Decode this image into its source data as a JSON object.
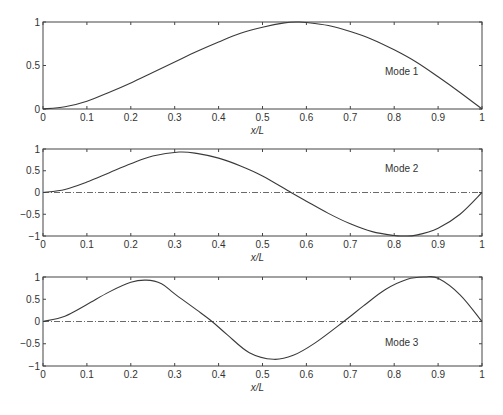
{
  "chart_data": [
    {
      "type": "line",
      "title": "",
      "xlabel": "x/L",
      "ylabel": "",
      "xlim": [
        0,
        1
      ],
      "ylim": [
        0,
        1
      ],
      "xticks": [
        "0",
        "0.1",
        "0.2",
        "0.3",
        "0.4",
        "0.5",
        "0.6",
        "0.7",
        "0.8",
        "0.9",
        "1"
      ],
      "yticks": [
        "0",
        "0.5",
        "1"
      ],
      "annotation": "Mode 1",
      "zero_line": false,
      "series": [
        {
          "name": "Mode 1",
          "x": [
            0,
            0.05,
            0.1,
            0.15,
            0.2,
            0.25,
            0.3,
            0.35,
            0.4,
            0.45,
            0.5,
            0.55,
            0.58,
            0.6,
            0.65,
            0.7,
            0.75,
            0.8,
            0.85,
            0.9,
            0.95,
            1
          ],
          "y": [
            0,
            0.025,
            0.09,
            0.19,
            0.3,
            0.42,
            0.54,
            0.66,
            0.77,
            0.87,
            0.94,
            0.99,
            1.0,
            0.995,
            0.96,
            0.89,
            0.8,
            0.68,
            0.54,
            0.37,
            0.19,
            0
          ]
        }
      ]
    },
    {
      "type": "line",
      "title": "",
      "xlabel": "x/L",
      "ylabel": "",
      "xlim": [
        0,
        1
      ],
      "ylim": [
        -1,
        1
      ],
      "xticks": [
        "0",
        "0.1",
        "0.2",
        "0.3",
        "0.4",
        "0.5",
        "0.6",
        "0.7",
        "0.8",
        "0.9",
        "1"
      ],
      "yticks": [
        "-1",
        "-0.5",
        "0",
        "0.5",
        "1"
      ],
      "annotation": "Mode 2",
      "zero_line": true,
      "series": [
        {
          "name": "Mode 2",
          "x": [
            0,
            0.05,
            0.1,
            0.15,
            0.2,
            0.25,
            0.31,
            0.35,
            0.4,
            0.45,
            0.5,
            0.565,
            0.6,
            0.65,
            0.7,
            0.75,
            0.8,
            0.82,
            0.85,
            0.9,
            0.95,
            1
          ],
          "y": [
            0,
            0.07,
            0.24,
            0.45,
            0.66,
            0.84,
            0.93,
            0.9,
            0.79,
            0.61,
            0.38,
            0,
            -0.2,
            -0.48,
            -0.72,
            -0.9,
            -0.99,
            -1.0,
            -0.98,
            -0.82,
            -0.5,
            0
          ]
        }
      ]
    },
    {
      "type": "line",
      "title": "",
      "xlabel": "x/L",
      "ylabel": "",
      "xlim": [
        0,
        1
      ],
      "ylim": [
        -1,
        1
      ],
      "xticks": [
        "0",
        "0.1",
        "0.2",
        "0.3",
        "0.4",
        "0.5",
        "0.6",
        "0.7",
        "0.8",
        "0.9",
        "1"
      ],
      "yticks": [
        "-1",
        "-0.5",
        "0",
        "0.5",
        "1"
      ],
      "annotation": "Mode 3",
      "zero_line": true,
      "series": [
        {
          "name": "Mode 3",
          "x": [
            0,
            0.05,
            0.1,
            0.15,
            0.2,
            0.235,
            0.27,
            0.3,
            0.35,
            0.385,
            0.42,
            0.47,
            0.525,
            0.57,
            0.62,
            0.685,
            0.73,
            0.78,
            0.83,
            0.87,
            0.9,
            0.95,
            1
          ],
          "y": [
            0,
            0.12,
            0.38,
            0.66,
            0.88,
            0.93,
            0.85,
            0.62,
            0.26,
            0,
            -0.3,
            -0.7,
            -0.85,
            -0.76,
            -0.48,
            0,
            0.35,
            0.72,
            0.95,
            1.0,
            0.97,
            0.6,
            0
          ]
        }
      ]
    }
  ]
}
